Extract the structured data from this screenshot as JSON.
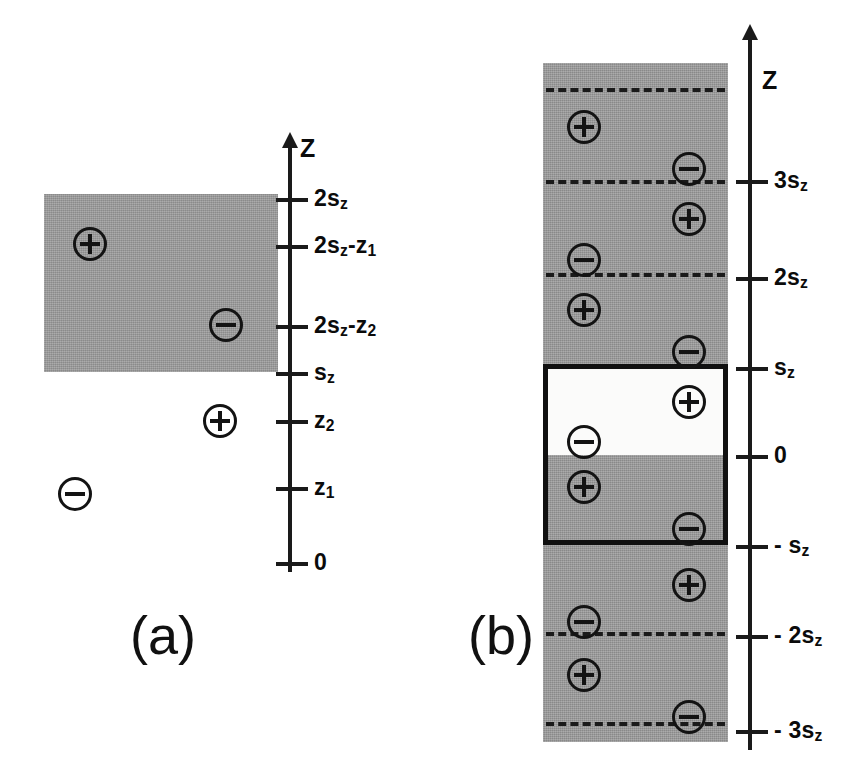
{
  "figure": {
    "background_color": "#ffffff",
    "slab_color": "#9a9a9a",
    "ink_color": "#131313",
    "width": 856,
    "height": 777
  },
  "panels": [
    {
      "id": "a",
      "caption": "(a)",
      "caption_x": 130,
      "caption_y": 608,
      "slab": {
        "x": 44,
        "y": 194,
        "width": 234,
        "height": 178,
        "fill": "shaded"
      },
      "axis": {
        "name": "Z",
        "name_x": 300,
        "name_y": 136,
        "x": 288,
        "top": 146,
        "bottom": 572,
        "ticks": [
          {
            "label": "2s",
            "sub": "z",
            "sup": "",
            "y": 198,
            "text": "2s_z"
          },
          {
            "label": "2s",
            "sub": "z",
            "y": 245,
            "text": "2s_z-z_1"
          },
          {
            "label": "2s",
            "sub": "z",
            "y": 325,
            "text": "2s_z-z_2"
          },
          {
            "label": "s",
            "sub": "z",
            "y": 372,
            "text": "s_z"
          },
          {
            "label": "z",
            "sub": "2",
            "y": 420,
            "text": "z_2"
          },
          {
            "label": "z",
            "sub": "1",
            "y": 487,
            "text": "z_1"
          },
          {
            "label": "0",
            "sub": "",
            "y": 562,
            "text": "0"
          }
        ]
      },
      "charges": [
        {
          "sign": "+",
          "x": 73,
          "y": 227,
          "inside_slab": true
        },
        {
          "sign": "-",
          "x": 209,
          "y": 308,
          "inside_slab": true
        },
        {
          "sign": "+",
          "x": 203,
          "y": 404,
          "inside_slab": false
        },
        {
          "sign": "-",
          "x": 58,
          "y": 477,
          "inside_slab": false
        }
      ]
    },
    {
      "id": "b",
      "caption": "(b)",
      "caption_x": 468,
      "caption_y": 608,
      "column": {
        "x": 543,
        "y": 63,
        "width": 185,
        "height": 679
      },
      "highlight_box": {
        "x": 543,
        "y": 364,
        "width": 185,
        "height": 181
      },
      "white_cell": {
        "x": 546,
        "y": 367,
        "width": 179,
        "height": 88
      },
      "dashed_lines_y": [
        88,
        273,
        632,
        722
      ],
      "axis": {
        "name": "Z",
        "name_x": 758,
        "name_y": 68,
        "x": 748,
        "top": 38,
        "bottom": 750,
        "ticks": [
          {
            "y": 180,
            "text": "3s_z"
          },
          {
            "y": 277,
            "text": "2s_z"
          },
          {
            "y": 367,
            "text": "s_z"
          },
          {
            "y": 455,
            "text": "0"
          },
          {
            "y": 545,
            "text": "- s_z"
          },
          {
            "y": 635,
            "text": "- 2s_z"
          },
          {
            "y": 730,
            "text": "- 3s_z"
          }
        ]
      },
      "charges": [
        {
          "sign": "+",
          "x": 567,
          "y": 110
        },
        {
          "sign": "-",
          "x": 672,
          "y": 152
        },
        {
          "sign": "+",
          "x": 672,
          "y": 202
        },
        {
          "sign": "-",
          "x": 567,
          "y": 243
        },
        {
          "sign": "+",
          "x": 567,
          "y": 293
        },
        {
          "sign": "-",
          "x": 672,
          "y": 335
        },
        {
          "sign": "+",
          "x": 672,
          "y": 385
        },
        {
          "sign": "-",
          "x": 567,
          "y": 425
        },
        {
          "sign": "+",
          "x": 567,
          "y": 470
        },
        {
          "sign": "-",
          "x": 672,
          "y": 512
        },
        {
          "sign": "+",
          "x": 672,
          "y": 568
        },
        {
          "sign": "-",
          "x": 567,
          "y": 605
        },
        {
          "sign": "+",
          "x": 567,
          "y": 658
        },
        {
          "sign": "-",
          "x": 672,
          "y": 700
        }
      ]
    }
  ],
  "labels": {
    "axis_a": {
      "z_name": "Z",
      "t0": "2s",
      "t0_sub": "z",
      "t1_pre": "2s",
      "t1_sub": "z",
      "t1_post": "-z",
      "t1_post_sub": "1",
      "t2_pre": "2s",
      "t2_sub": "z",
      "t2_post": "-z",
      "t2_post_sub": "2",
      "t3": "s",
      "t3_sub": "z",
      "t4": "z",
      "t4_sub": "2",
      "t5": "z",
      "t5_sub": "1",
      "t6": "0"
    },
    "axis_b": {
      "z_name": "Z",
      "b0": "3s",
      "b0_sub": "z",
      "b1": "2s",
      "b1_sub": "z",
      "b2": "s",
      "b2_sub": "z",
      "b3": "0",
      "b4": "- s",
      "b4_sub": "z",
      "b5": "- 2s",
      "b5_sub": "z",
      "b6": "- 3s",
      "b6_sub": "z"
    },
    "caption_a": "(a)",
    "caption_b": "(b)"
  }
}
